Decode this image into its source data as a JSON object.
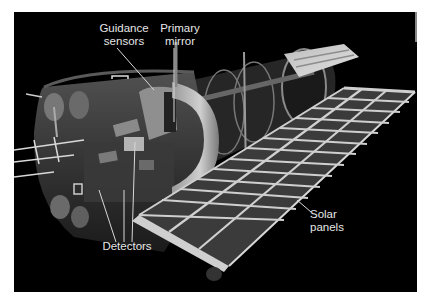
{
  "figure": {
    "background_color": "#000000",
    "label_color": "#e6e6e6",
    "labels": [
      {
        "id": "guidance-sensors",
        "lines": [
          "Guidance",
          "sensors"
        ]
      },
      {
        "id": "primary-mirror",
        "lines": [
          "Primary",
          "mirror"
        ]
      },
      {
        "id": "detectors",
        "lines": [
          "Detectors"
        ]
      },
      {
        "id": "solar-panels",
        "lines": [
          "Solar",
          "panels"
        ]
      }
    ]
  }
}
